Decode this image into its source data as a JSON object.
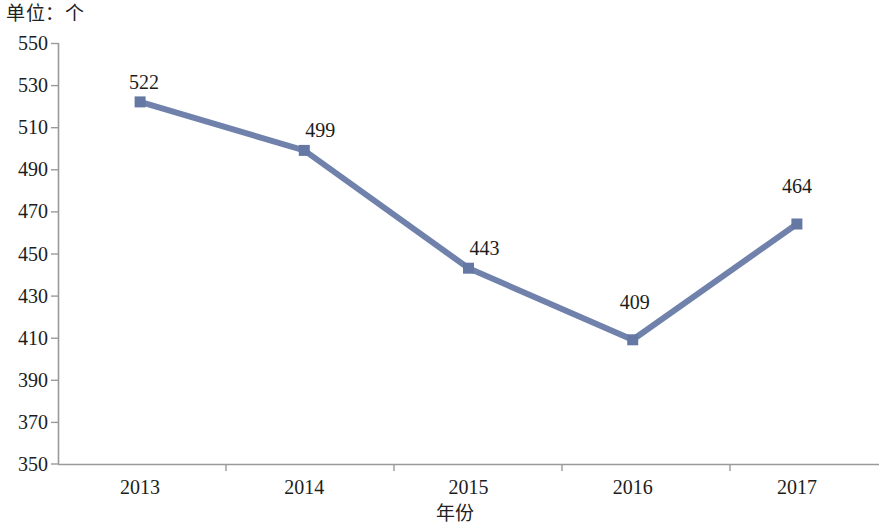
{
  "chart_data": {
    "type": "line",
    "title": "单位：个",
    "xlabel": "年份",
    "ylabel": "",
    "categories": [
      "2013",
      "2014",
      "2015",
      "2016",
      "2017"
    ],
    "values": [
      522,
      499,
      443,
      409,
      464
    ],
    "data_labels": [
      "522",
      "499",
      "443",
      "409",
      "464"
    ],
    "ylim": [
      350,
      550
    ],
    "ytick_step": 20,
    "ytick_labels": [
      "550",
      "530",
      "510",
      "490",
      "470",
      "450",
      "430",
      "410",
      "390",
      "370",
      "350"
    ],
    "ytick_values": [
      550,
      530,
      510,
      490,
      470,
      450,
      430,
      410,
      390,
      370,
      350
    ],
    "grid": false,
    "legend": false,
    "legend_position": "none",
    "series": [
      {
        "name": "",
        "values": [
          522,
          499,
          443,
          409,
          464
        ],
        "color": "#7082ac",
        "marker": "square",
        "line_width": 6
      }
    ]
  },
  "axes": {
    "y_axis_name": "y-axis",
    "x_axis_name": "x-axis"
  },
  "colors": {
    "series": "#7082ac",
    "marker": "#6578a3",
    "axis": "#9a9a9a",
    "text": "#1c1c1c"
  }
}
